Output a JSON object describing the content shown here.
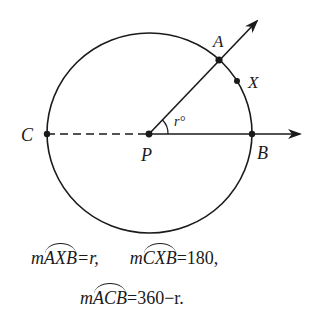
{
  "diagram": {
    "points": {
      "A": {
        "label": "A",
        "x": 219,
        "y": 60
      },
      "X": {
        "label": "X",
        "x": 237,
        "y": 81
      },
      "C": {
        "label": "C",
        "x": 47,
        "y": 134
      },
      "P": {
        "label": "P",
        "x": 149,
        "y": 134
      },
      "B": {
        "label": "B",
        "x": 252,
        "y": 134
      }
    },
    "angle_label": "r°",
    "colors": {
      "stroke": "#1a1a1a",
      "background": "#ffffff"
    }
  },
  "equations": {
    "line1": {
      "eq1": {
        "prefix": "m",
        "arc": "AXB",
        "rhs": "=r,"
      },
      "eq2": {
        "prefix": "m",
        "arc": "CXB",
        "rhs": "=180,"
      }
    },
    "line2": {
      "eq3": {
        "prefix": "m",
        "arc": "ACB",
        "rhs": "=360−r."
      }
    }
  }
}
